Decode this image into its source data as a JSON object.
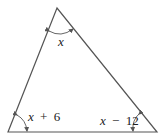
{
  "diagram": {
    "type": "triangle",
    "vertices": {
      "top": [
        57,
        8
      ],
      "bottom_left": [
        8,
        132
      ],
      "bottom_right": [
        157,
        132
      ]
    },
    "angles": [
      {
        "name": "top",
        "var": "x",
        "op": "",
        "const": ""
      },
      {
        "name": "bottom_left",
        "var": "x",
        "op": "+",
        "const": "6"
      },
      {
        "name": "bottom_right",
        "var": "x",
        "op": "−",
        "const": "12"
      }
    ],
    "colors": {
      "stroke": "#555555",
      "text": "#222222"
    }
  }
}
